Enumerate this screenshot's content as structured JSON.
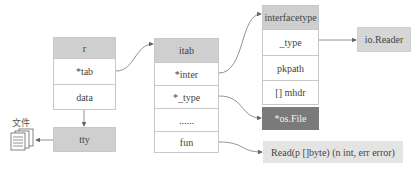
{
  "diagram": {
    "r": {
      "header": "r",
      "rows": [
        "*tab",
        "data"
      ]
    },
    "tty": {
      "label": "tty"
    },
    "file": {
      "label": "文件",
      "icon": "file-stack-icon"
    },
    "itab": {
      "header": "itab",
      "rows": [
        "*inter",
        "*_type",
        "......",
        "fun"
      ]
    },
    "interfacetype": {
      "header": "interfacetype",
      "rows": [
        "_type",
        "pkpath",
        "[] mhdr"
      ]
    },
    "io_reader": {
      "label": "io.Reader"
    },
    "os_file": {
      "label": "*os.File"
    },
    "read_func": {
      "label": "Read(p []byte) (n int, err error)"
    },
    "colors": {
      "header_gray": "#cfcfcf",
      "dark_gray": "#7a7a7a",
      "light_gray": "#e4e4e4",
      "border": "#c8c8c8",
      "line": "#666666"
    },
    "edges": [
      {
        "from": "r.*tab",
        "to": "itab"
      },
      {
        "from": "r.data",
        "to": "tty"
      },
      {
        "from": "tty",
        "to": "file"
      },
      {
        "from": "itab.*inter",
        "to": "interfacetype"
      },
      {
        "from": "itab.*_type",
        "to": "*os.File"
      },
      {
        "from": "itab.fun",
        "to": "Read(p []byte) (n int, err error)"
      },
      {
        "from": "interfacetype._type",
        "to": "io.Reader"
      }
    ]
  }
}
